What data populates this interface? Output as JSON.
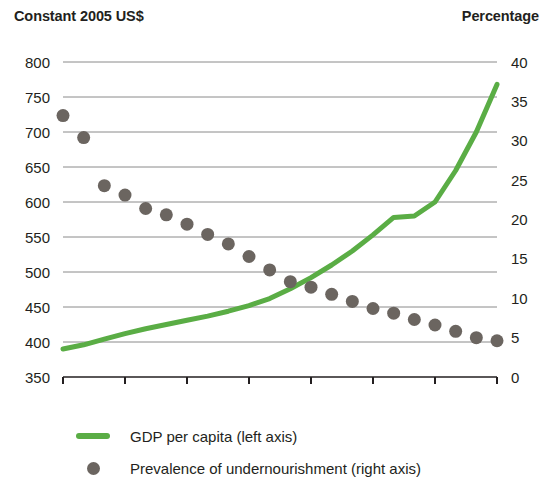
{
  "header": {
    "left_axis_title": "Constant 2005 US$",
    "right_axis_title": "Percentage"
  },
  "legend": {
    "items": [
      {
        "label": "GDP per capita (left axis)",
        "marker": "line-swatch",
        "color": "#5aad45"
      },
      {
        "label": "Prevalence of undernourishment (right axis)",
        "marker": "dot-swatch",
        "color": "#6b6560"
      }
    ]
  },
  "chart_data": {
    "type": "line",
    "title": "",
    "subtitle": "",
    "xlabel": "",
    "ylabel": "Constant 2005 US$",
    "y2label": "Percentage",
    "grid": true,
    "legend_position": "bottom",
    "x": [
      1992,
      1993,
      1994,
      1995,
      1996,
      1997,
      1998,
      1999,
      2000,
      2001,
      2002,
      2003,
      2004,
      2005,
      2006,
      2007,
      2008,
      2009,
      2010,
      2011,
      2012,
      2013
    ],
    "xlim": [
      1992,
      2013
    ],
    "xticks": [
      1992,
      1995,
      1998,
      2001,
      2004,
      2007,
      2010,
      2013
    ],
    "xtick_labels": [
      "1992",
      "1995",
      "1998",
      "2001",
      "2004",
      "2007",
      "2010",
      "2013"
    ],
    "ylim": [
      350,
      800
    ],
    "yticks": [
      350,
      400,
      450,
      500,
      550,
      600,
      650,
      700,
      750,
      800
    ],
    "ytick_labels": [
      "350",
      "400",
      "450",
      "500",
      "550",
      "600",
      "650",
      "700",
      "750",
      "800"
    ],
    "y2lim": [
      0,
      40
    ],
    "y2ticks": [
      0,
      5,
      10,
      15,
      20,
      25,
      30,
      35,
      40
    ],
    "y2tick_labels": [
      "0",
      "5",
      "10",
      "15",
      "20",
      "25",
      "30",
      "35",
      "40"
    ],
    "series": [
      {
        "name": "GDP per capita (left axis)",
        "type": "line",
        "axis": "left",
        "color": "#5aad45",
        "line_width": 5,
        "values": [
          390,
          396,
          404,
          412,
          419,
          425,
          431,
          437,
          444,
          452,
          462,
          476,
          492,
          510,
          530,
          553,
          578,
          580,
          600,
          645,
          700,
          768
        ]
      },
      {
        "name": "Prevalence of undernourishment (right axis)",
        "type": "scatter",
        "axis": "right",
        "color": "#6b6560",
        "marker": "circle",
        "marker_size": 13,
        "values": [
          33.2,
          30.4,
          24.3,
          23.1,
          21.4,
          20.6,
          19.4,
          18.1,
          16.9,
          15.3,
          13.6,
          12.1,
          11.4,
          10.5,
          9.6,
          8.7,
          8.1,
          7.3,
          6.6,
          5.8,
          5.0,
          4.6
        ]
      }
    ]
  }
}
